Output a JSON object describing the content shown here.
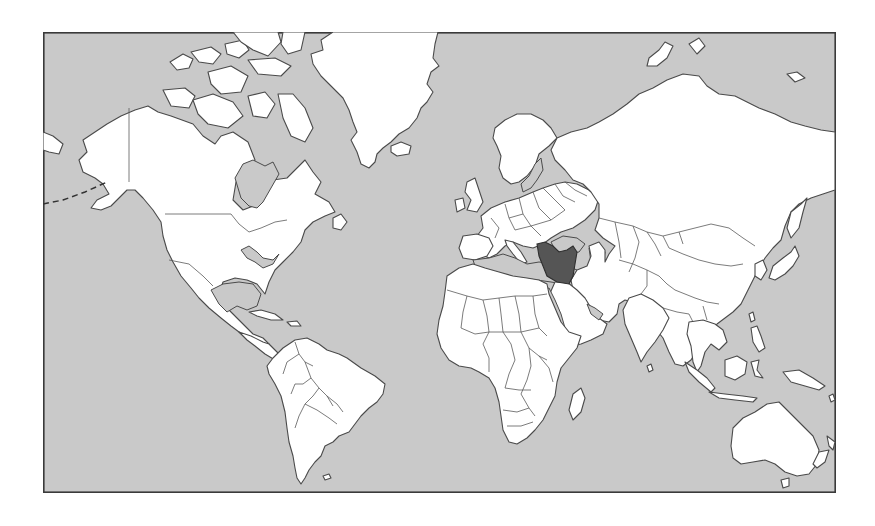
{
  "map": {
    "caption": "World map (Mercator) with Iran highlighted",
    "projection": "mercator",
    "colors": {
      "ocean": "#c9c9c9",
      "land": "#ffffff",
      "border": "#4a4a4a",
      "highlight": "#555555",
      "frame": "#3a3a3a"
    },
    "highlighted_country": "Iran",
    "regions": [
      "North America",
      "Greenland",
      "South America",
      "Europe",
      "Africa",
      "Asia",
      "Middle East",
      "Australia",
      "New Zealand",
      "Indonesia",
      "Japan"
    ]
  }
}
